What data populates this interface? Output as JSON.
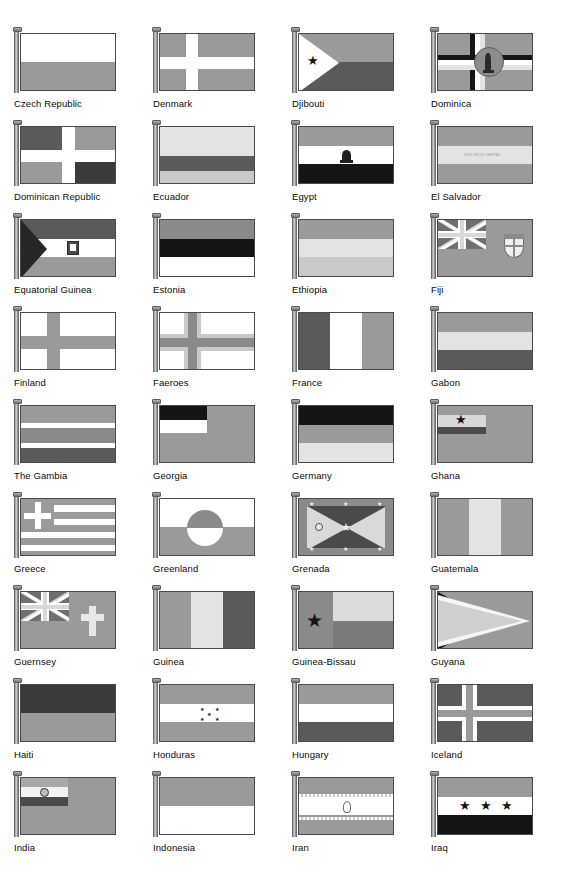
{
  "page": {
    "kind": "flag-reference-chart",
    "columns": 4,
    "rows": 9,
    "total_flags": 36,
    "range": "Czech Republic to Iraq",
    "rendering": "grayscale halftone print"
  },
  "palette": {
    "white": "#ffffff",
    "very_light": "#e3e3e3",
    "light": "#c9c9c9",
    "mid": "#9a9a9a",
    "mid2": "#8a8a8a",
    "dark": "#5a5a5a",
    "very_dark": "#3a3a3a",
    "black": "#141414",
    "pole": "#8f8f8f",
    "outline": "#4a4a4a",
    "label_text": "#0a0a0a"
  },
  "inscriptions": {
    "el_salvador": "DIOS UNION LIBERTAD"
  },
  "flags": [
    {
      "name": "Czech Republic",
      "row": 1,
      "col": 1
    },
    {
      "name": "Denmark",
      "row": 1,
      "col": 2
    },
    {
      "name": "Djibouti",
      "row": 1,
      "col": 3
    },
    {
      "name": "Dominica",
      "row": 1,
      "col": 4
    },
    {
      "name": "Dominican Republic",
      "row": 2,
      "col": 1
    },
    {
      "name": "Ecuador",
      "row": 2,
      "col": 2
    },
    {
      "name": "Egypt",
      "row": 2,
      "col": 3
    },
    {
      "name": "El Salvador",
      "row": 2,
      "col": 4
    },
    {
      "name": "Equatorial Guinea",
      "row": 3,
      "col": 1
    },
    {
      "name": "Estonia",
      "row": 3,
      "col": 2
    },
    {
      "name": "Ethiopia",
      "row": 3,
      "col": 3
    },
    {
      "name": "Fiji",
      "row": 3,
      "col": 4
    },
    {
      "name": "Finland",
      "row": 4,
      "col": 1
    },
    {
      "name": "Faeroes",
      "row": 4,
      "col": 2
    },
    {
      "name": "France",
      "row": 4,
      "col": 3
    },
    {
      "name": "Gabon",
      "row": 4,
      "col": 4
    },
    {
      "name": "The Gambia",
      "row": 5,
      "col": 1
    },
    {
      "name": "Georgia",
      "row": 5,
      "col": 2
    },
    {
      "name": "Germany",
      "row": 5,
      "col": 3
    },
    {
      "name": "Ghana",
      "row": 5,
      "col": 4
    },
    {
      "name": "Greece",
      "row": 6,
      "col": 1
    },
    {
      "name": "Greenland",
      "row": 6,
      "col": 2
    },
    {
      "name": "Grenada",
      "row": 6,
      "col": 3
    },
    {
      "name": "Guatemala",
      "row": 6,
      "col": 4
    },
    {
      "name": "Guernsey",
      "row": 7,
      "col": 1
    },
    {
      "name": "Guinea",
      "row": 7,
      "col": 2
    },
    {
      "name": "Guinea-Bissau",
      "row": 7,
      "col": 3
    },
    {
      "name": "Guyana",
      "row": 7,
      "col": 4
    },
    {
      "name": "Haiti",
      "row": 8,
      "col": 1
    },
    {
      "name": "Honduras",
      "row": 8,
      "col": 2
    },
    {
      "name": "Hungary",
      "row": 8,
      "col": 3
    },
    {
      "name": "Iceland",
      "row": 8,
      "col": 4
    },
    {
      "name": "India",
      "row": 9,
      "col": 1
    },
    {
      "name": "Indonesia",
      "row": 9,
      "col": 2
    },
    {
      "name": "Iran",
      "row": 9,
      "col": 3
    },
    {
      "name": "Iraq",
      "row": 9,
      "col": 4
    }
  ]
}
